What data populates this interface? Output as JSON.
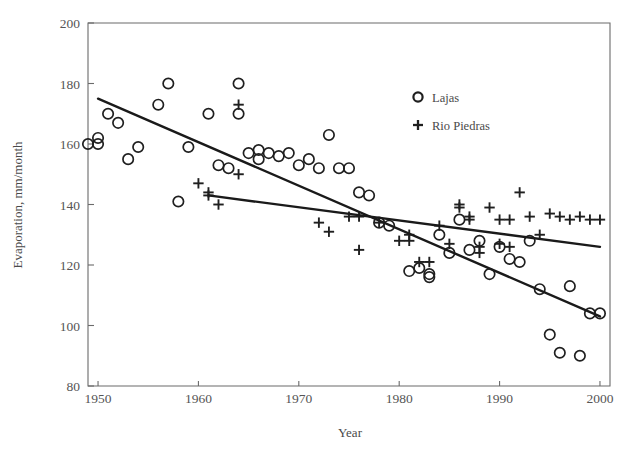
{
  "chart_data": {
    "type": "scatter",
    "title": "",
    "xlabel": "Year",
    "ylabel": "Evaporation, mm/month",
    "xlim": [
      1949,
      2001
    ],
    "ylim": [
      80,
      200
    ],
    "xticks": [
      1950,
      1960,
      1970,
      1980,
      1990,
      2000
    ],
    "yticks": [
      80,
      100,
      120,
      140,
      160,
      180,
      200
    ],
    "grid": false,
    "legend_position": "top-right",
    "legend": [
      {
        "name": "Lajas",
        "marker": "circle"
      },
      {
        "name": "Rio Piedras",
        "marker": "plus"
      }
    ],
    "series": [
      {
        "name": "Lajas",
        "marker": "circle",
        "points": [
          [
            1949,
            160
          ],
          [
            1950,
            160
          ],
          [
            1950,
            162
          ],
          [
            1951,
            170
          ],
          [
            1952,
            167
          ],
          [
            1953,
            155
          ],
          [
            1954,
            159
          ],
          [
            1956,
            173
          ],
          [
            1957,
            180
          ],
          [
            1958,
            141
          ],
          [
            1959,
            159
          ],
          [
            1961,
            170
          ],
          [
            1962,
            153
          ],
          [
            1963,
            152
          ],
          [
            1964,
            180
          ],
          [
            1964,
            170
          ],
          [
            1965,
            157
          ],
          [
            1966,
            158
          ],
          [
            1966,
            155
          ],
          [
            1967,
            157
          ],
          [
            1968,
            156
          ],
          [
            1969,
            157
          ],
          [
            1970,
            153
          ],
          [
            1971,
            155
          ],
          [
            1972,
            152
          ],
          [
            1973,
            163
          ],
          [
            1974,
            152
          ],
          [
            1975,
            152
          ],
          [
            1976,
            144
          ],
          [
            1977,
            143
          ],
          [
            1978,
            134
          ],
          [
            1979,
            133
          ],
          [
            1981,
            118
          ],
          [
            1982,
            119
          ],
          [
            1983,
            117
          ],
          [
            1983,
            116
          ],
          [
            1984,
            130
          ],
          [
            1985,
            124
          ],
          [
            1986,
            135
          ],
          [
            1987,
            125
          ],
          [
            1988,
            128
          ],
          [
            1989,
            117
          ],
          [
            1990,
            126
          ],
          [
            1991,
            122
          ],
          [
            1992,
            121
          ],
          [
            1993,
            128
          ],
          [
            1994,
            112
          ],
          [
            1995,
            97
          ],
          [
            1996,
            91
          ],
          [
            1997,
            113
          ],
          [
            1998,
            90
          ],
          [
            1999,
            104
          ],
          [
            2000,
            104
          ]
        ]
      },
      {
        "name": "Rio Piedras",
        "marker": "plus",
        "points": [
          [
            1960,
            147
          ],
          [
            1961,
            144
          ],
          [
            1961,
            143
          ],
          [
            1962,
            140
          ],
          [
            1964,
            173
          ],
          [
            1964,
            150
          ],
          [
            1972,
            134
          ],
          [
            1973,
            131
          ],
          [
            1975,
            136
          ],
          [
            1976,
            136
          ],
          [
            1976,
            125
          ],
          [
            1978,
            134
          ],
          [
            1980,
            128
          ],
          [
            1981,
            130
          ],
          [
            1981,
            128
          ],
          [
            1982,
            121
          ],
          [
            1983,
            121
          ],
          [
            1984,
            133
          ],
          [
            1985,
            127
          ],
          [
            1986,
            139
          ],
          [
            1986,
            140
          ],
          [
            1987,
            136
          ],
          [
            1987,
            135
          ],
          [
            1988,
            126
          ],
          [
            1988,
            124
          ],
          [
            1989,
            139
          ],
          [
            1990,
            135
          ],
          [
            1990,
            127
          ],
          [
            1991,
            135
          ],
          [
            1991,
            126
          ],
          [
            1992,
            144
          ],
          [
            1993,
            136
          ],
          [
            1994,
            130
          ],
          [
            1995,
            137
          ],
          [
            1996,
            136
          ],
          [
            1997,
            135
          ],
          [
            1998,
            136
          ],
          [
            1999,
            135
          ],
          [
            2000,
            135
          ]
        ]
      }
    ],
    "trendlines": [
      {
        "name": "Lajas",
        "x": [
          1950,
          2000
        ],
        "y": [
          175,
          103
        ]
      },
      {
        "name": "Rio Piedras",
        "x": [
          1961,
          2000
        ],
        "y": [
          143,
          126
        ]
      }
    ]
  },
  "axes": {
    "x_title": "Year",
    "y_title": "Evaporation, mm/month",
    "x_tick_labels": [
      "1950",
      "1960",
      "1970",
      "1980",
      "1990",
      "2000"
    ],
    "y_tick_labels": [
      "200",
      "180",
      "160",
      "140",
      "120",
      "100",
      "80"
    ]
  },
  "legend": {
    "items": [
      {
        "label": "Lajas",
        "marker": "circle-marker-icon"
      },
      {
        "label": "Rio Piedras",
        "marker": "plus-marker-icon"
      }
    ]
  },
  "colors": {
    "marker": "#1f1f1f",
    "trend": "#1a1a1a",
    "axis": "#6b6b6b",
    "text": "#4a4a4a",
    "background": "#ffffff"
  }
}
